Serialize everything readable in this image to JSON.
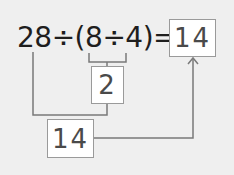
{
  "diagram": {
    "expression": "28÷(8÷4)=",
    "expression_parts": {
      "dividend": "28",
      "operator_1": "÷",
      "open_paren": "(",
      "inner_left": "8",
      "operator_2": "÷",
      "inner_right": "4",
      "close_paren": ")",
      "equals": "="
    },
    "answer_box": "14",
    "intermediate_box": "2",
    "result_box": "14",
    "colors": {
      "background": "#efefef",
      "text": "#1e1e1e",
      "box_text": "#4a4a4a",
      "line": "#7a7a7a",
      "box_border": "#9a9a9a"
    }
  }
}
